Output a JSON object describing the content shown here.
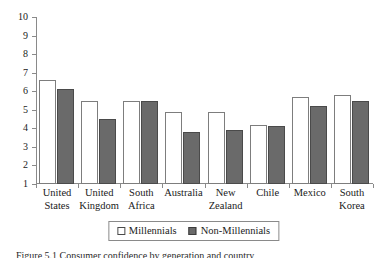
{
  "chart_data": {
    "type": "bar",
    "title": "",
    "subtitle": "",
    "xlabel": "",
    "ylabel": "",
    "ylim": [
      1,
      10
    ],
    "yticks": [
      1,
      2,
      3,
      4,
      5,
      6,
      7,
      8,
      9,
      10
    ],
    "ytick_labels": [
      "1",
      "2",
      "3",
      "4",
      "5",
      "6",
      "7",
      "8",
      "9",
      "10"
    ],
    "grid": false,
    "legend_position": "bottom-center",
    "categories": [
      "United\nStates",
      "United\nKingdom",
      "South\nAfrica",
      "Australia",
      "New\nZealand",
      "Chile",
      "Mexico",
      "South\nKorea"
    ],
    "series": [
      {
        "name": "Millennials",
        "color": "#ffffff",
        "edge_color": "#7d7d7d",
        "values": [
          6.6,
          5.5,
          5.5,
          4.9,
          4.9,
          4.2,
          5.7,
          5.8
        ]
      },
      {
        "name": "Non-Millennials",
        "color": "#6a6a6a",
        "edge_color": "#4a4a4a",
        "values": [
          6.1,
          4.5,
          5.5,
          3.8,
          3.9,
          4.1,
          5.2,
          5.5
        ]
      }
    ]
  },
  "legend": {
    "entries": [
      {
        "label": "Millennials",
        "swatch": "open-square-swatch"
      },
      {
        "label": "Non-Millennials",
        "swatch": "filled-square-swatch"
      }
    ]
  },
  "caption": {
    "text": "Figure 5.1  Consumer confidence by generation and country"
  }
}
